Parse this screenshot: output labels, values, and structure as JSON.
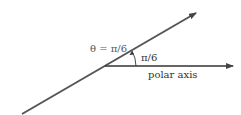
{
  "diagram": {
    "ray_angle_label": "θ = π/6",
    "angle_arc_label": "π/6",
    "axis_label": "polar axis",
    "angle_degrees": 30,
    "line_color": "#444444",
    "text_color": "#333333"
  }
}
